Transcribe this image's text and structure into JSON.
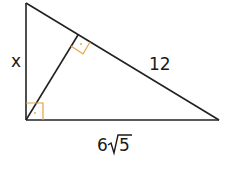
{
  "diagram": {
    "type": "right-triangle-with-altitude",
    "labels": {
      "left_leg": "x",
      "hypotenuse_segment": "12",
      "base": "6√5",
      "base_coeff": "6",
      "base_radicand": "5"
    },
    "colors": {
      "lines": "#222222",
      "right_angle_marks": "#e8a040"
    }
  }
}
